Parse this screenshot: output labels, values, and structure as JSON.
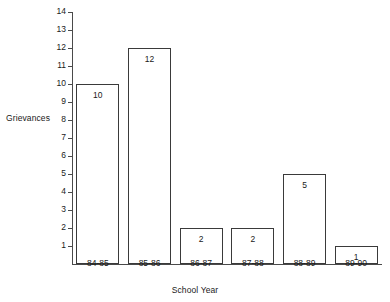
{
  "chart_data": {
    "type": "bar",
    "title": "",
    "xlabel": "School Year",
    "ylabel": "Grievances",
    "categories": [
      "84-85",
      "85-86",
      "86-87",
      "87-88",
      "88-89",
      "89-90"
    ],
    "values": [
      10,
      12,
      2,
      2,
      5,
      1
    ],
    "value_labels": [
      "10",
      "12",
      "2",
      "2",
      "5",
      "1"
    ],
    "ylim": [
      0,
      14
    ],
    "yticks": [
      1,
      2,
      3,
      4,
      5,
      6,
      7,
      8,
      9,
      10,
      11,
      12,
      13,
      14
    ],
    "ytick_labels": [
      "1",
      "2",
      "3",
      "4",
      "5",
      "6",
      "7",
      "8",
      "9",
      "10",
      "11",
      "12",
      "13",
      "14"
    ],
    "grid": false,
    "legend": null,
    "bar_fill": "#ffffff",
    "bar_edge_color": "#3a3a3a",
    "axis_color": "#4a4a4a",
    "background": "#ffffff"
  }
}
